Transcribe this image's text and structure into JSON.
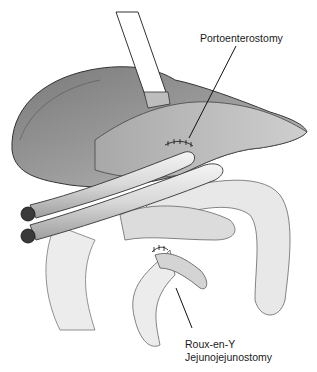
{
  "figure": {
    "labels": {
      "portoenterostomy": "Portoenterostomy",
      "roux_line1": "Roux-en-Y",
      "roux_line2": "Jejunojejunostomy"
    }
  }
}
